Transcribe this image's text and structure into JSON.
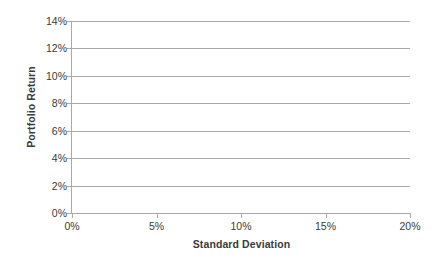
{
  "chart_data": {
    "type": "line",
    "title": "",
    "subtitle": "",
    "xlabel": "Standard Deviation",
    "ylabel": "Portfolio Return",
    "xlim": [
      0,
      20
    ],
    "ylim": [
      0,
      14
    ],
    "xticks": [
      0,
      5,
      10,
      15,
      20
    ],
    "xticklabels": [
      "0%",
      "5%",
      "10%",
      "15%",
      "20%"
    ],
    "yticks": [
      0,
      2,
      4,
      6,
      8,
      10,
      12,
      14
    ],
    "yticklabels": [
      "0%",
      "2%",
      "4%",
      "6%",
      "8%",
      "10%",
      "12%",
      "14%"
    ],
    "grid": "horizontal",
    "legend": "none",
    "series": [],
    "annotations": [],
    "note": "Empty plot frame: axes and horizontal gridlines only, no data plotted",
    "colors": {
      "background": "#ffffff",
      "gridline": "#a8a8a8",
      "axis": "#a8a8a8",
      "text": "#3a3a3a"
    }
  }
}
